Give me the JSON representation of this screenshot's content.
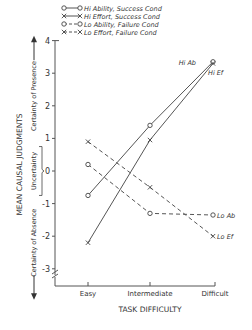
{
  "chart_data": {
    "type": "line",
    "title": "",
    "xlabel": "TASK DIFFICULTY",
    "ylabel": "MEAN CAUSAL JUDGMENTS",
    "categories": [
      "Easy",
      "Intermediate",
      "Difficult"
    ],
    "ylim": [
      -3.4,
      4
    ],
    "yticks": [
      "4",
      "3",
      "2",
      "1",
      "0",
      "-1",
      "-2",
      "-3"
    ],
    "y_annotations": {
      "top": "Certainty of Presence",
      "middle": "Uncertainty",
      "bottom": "Certainty of Absence"
    },
    "grid": false,
    "legend_position": "top-right",
    "series": [
      {
        "name": "Hi Ability, Success Cond",
        "short": "Hi Ab",
        "marker": "o",
        "line": "solid",
        "values": [
          -0.75,
          1.4,
          3.35
        ]
      },
      {
        "name": "Hi Effort, Success Cond",
        "short": "Hi Ef",
        "marker": "x",
        "line": "solid",
        "values": [
          -2.2,
          0.95,
          3.3
        ]
      },
      {
        "name": "Lo Ability, Failure Cond",
        "short": "Lo Ab",
        "marker": "o",
        "line": "dashed",
        "values": [
          0.2,
          -1.3,
          -1.35
        ]
      },
      {
        "name": "Lo Effort, Failure Cond",
        "short": "Lo Ef",
        "marker": "x",
        "line": "dashed",
        "values": [
          0.9,
          -0.5,
          -2.0
        ]
      }
    ]
  }
}
